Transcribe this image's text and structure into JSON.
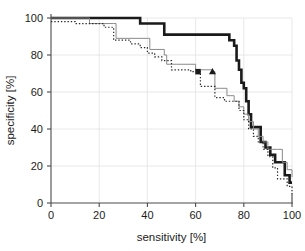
{
  "chart_data": {
    "type": "line",
    "title": "",
    "xlabel": "sensitivity [%]",
    "ylabel": "specificity [%]",
    "xlim": [
      0,
      100
    ],
    "ylim": [
      0,
      100
    ],
    "xticks": [
      0,
      20,
      40,
      60,
      80,
      100
    ],
    "yticks": [
      0,
      20,
      40,
      60,
      80,
      100
    ],
    "xtick_labels": [
      "0",
      "20",
      "40",
      "60",
      "80",
      "100"
    ],
    "ytick_labels": [
      "0",
      "20",
      "40",
      "60",
      "80",
      "100"
    ],
    "grid": true,
    "legend": "none",
    "step_mode": "post",
    "series": [
      {
        "name": "thick-black-curve",
        "style": "solid",
        "color": "#1a1a1a",
        "width": 2.6,
        "marker": "none",
        "x": [
          0,
          2,
          35,
          37,
          43,
          47,
          73,
          74,
          75,
          76,
          77,
          78,
          79,
          80,
          81,
          82,
          83,
          85,
          87,
          89,
          91,
          93,
          95,
          97,
          99,
          100
        ],
        "y": [
          100,
          100,
          100,
          97,
          97,
          91,
          91,
          88,
          88,
          85,
          77,
          72,
          65,
          62,
          55,
          48,
          41,
          41,
          33,
          30,
          26,
          22,
          22,
          15,
          11,
          11
        ]
      },
      {
        "name": "thin-gray-curve",
        "style": "solid",
        "color": "#8a8a8a",
        "width": 1.0,
        "marker": "triangle",
        "marker_x": 67,
        "marker_y": 71,
        "x": [
          0,
          14,
          16,
          22,
          26,
          27,
          40,
          41,
          44,
          47,
          48,
          52,
          60,
          67,
          68,
          70,
          73,
          76,
          78,
          80,
          82,
          84,
          86,
          88,
          90,
          92,
          94,
          96,
          98,
          100
        ],
        "y": [
          100,
          100,
          97,
          97,
          97,
          89,
          89,
          83,
          83,
          80,
          75,
          75,
          72,
          71,
          62,
          62,
          58,
          55,
          52,
          48,
          44,
          40,
          36,
          33,
          29,
          29,
          29,
          22,
          18,
          14
        ]
      },
      {
        "name": "dotted-curve",
        "style": "dotted",
        "color": "#2b2b2b",
        "width": 1.2,
        "marker": "square",
        "marker_x": 61,
        "marker_y": 71,
        "x": [
          0,
          5,
          10,
          18,
          22,
          25,
          26,
          29,
          33,
          37,
          40,
          43,
          46,
          48,
          50,
          55,
          58,
          61,
          62,
          64,
          68,
          72,
          75,
          78,
          80,
          82,
          84,
          86,
          88,
          90,
          92,
          94,
          96,
          98,
          100
        ],
        "y": [
          98,
          98,
          97,
          97,
          95,
          95,
          88,
          88,
          86,
          84,
          81,
          79,
          77,
          77,
          72,
          72,
          71,
          71,
          63,
          63,
          57,
          55,
          55,
          50,
          45,
          40,
          36,
          33,
          29,
          25,
          19,
          13,
          13,
          9,
          5
        ]
      }
    ],
    "markers": [
      {
        "name": "square-operating-point",
        "shape": "square",
        "x": 61,
        "y": 71,
        "color": "#1a1a1a",
        "size": 5.5
      },
      {
        "name": "triangle-operating-point",
        "shape": "triangle",
        "x": 67,
        "y": 71,
        "color": "#1a1a1a",
        "size": 6
      }
    ]
  },
  "plot": {
    "left": 51,
    "right": 292,
    "top": 18,
    "bottom": 203
  },
  "colors": {
    "axis": "#4a4a4a",
    "grid": "#e2e2e2",
    "text": "#1c1c1c",
    "background": "#ffffff"
  }
}
